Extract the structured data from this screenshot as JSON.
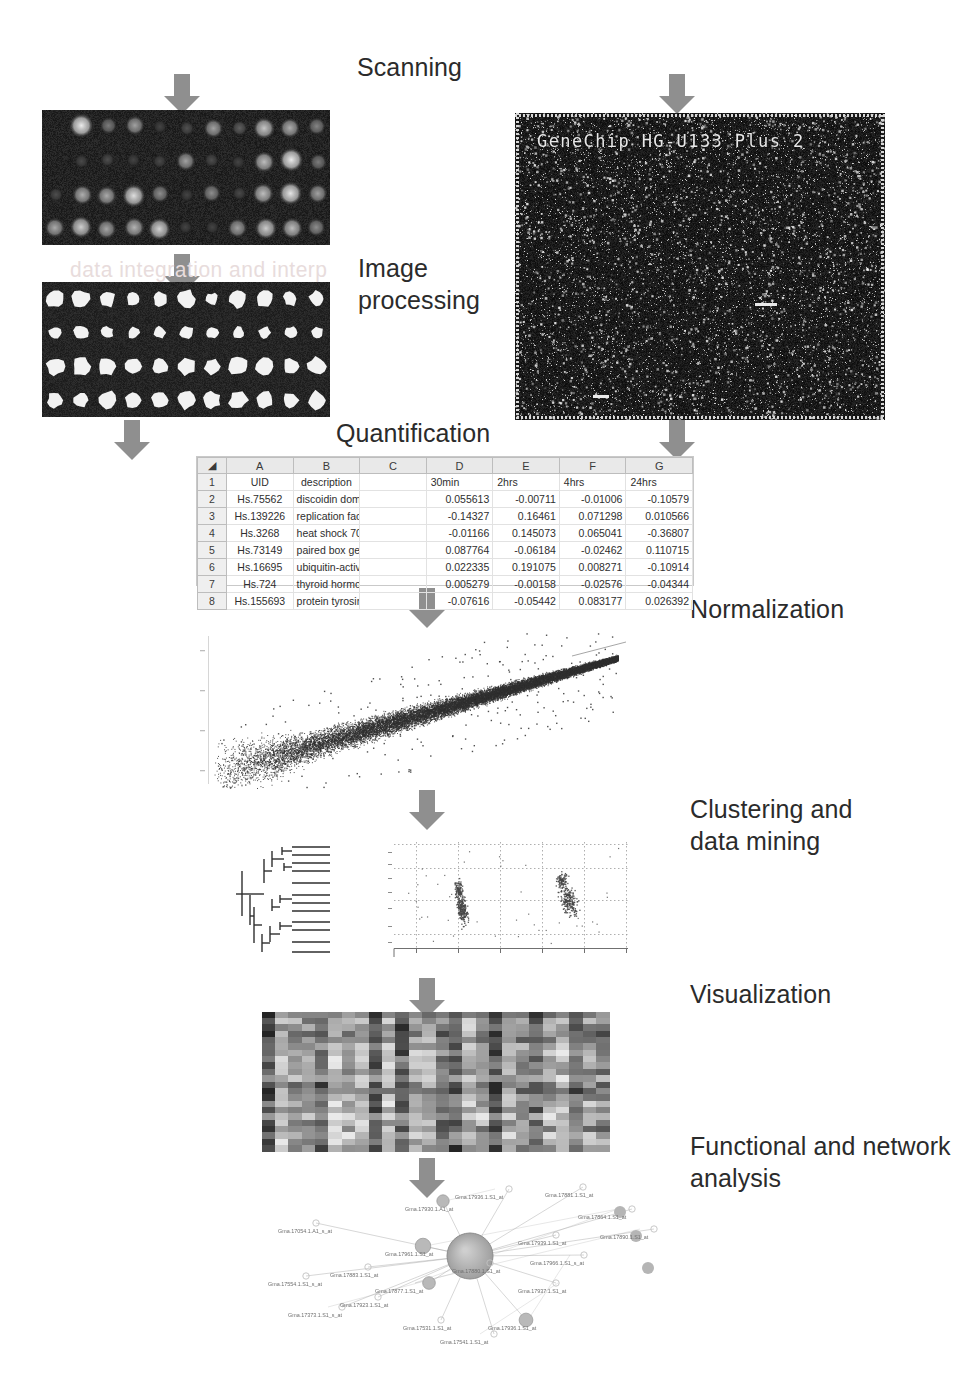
{
  "workflow": {
    "title": "Microarray data analysis workflow",
    "steps": [
      {
        "id": "scanning",
        "label": "Scanning"
      },
      {
        "id": "image-processing",
        "label": "Image\nprocessing"
      },
      {
        "id": "quantification",
        "label": "Quantification"
      },
      {
        "id": "normalization",
        "label": "Normalization"
      },
      {
        "id": "clustering",
        "label": "Clustering and\ndata mining"
      },
      {
        "id": "visualization",
        "label": "Visualization"
      },
      {
        "id": "functional",
        "label": "Functional and network\nanalysis"
      }
    ]
  },
  "colors": {
    "arrow": "#8f8f8f",
    "arrow_dark": "#7a7a7a",
    "panel_bg": "#101010",
    "text": "#2b2b2b",
    "grid": "#cfcfcf",
    "scatter": "#3a3a3a"
  },
  "panels": {
    "spotted_array": {
      "name": "two-colour spotted microarray scan",
      "rows": 4,
      "cols": 11
    },
    "segmented_array": {
      "name": "segmented / spot-found image",
      "rows": 4,
      "cols": 11
    },
    "genechip": {
      "name": "Affymetrix GeneChip array image",
      "label": "GeneChip HG-U133 Plus 2"
    },
    "ghost_text": "data integration and interp"
  },
  "spreadsheet": {
    "column_letters": [
      "",
      "A",
      "B",
      "C",
      "D",
      "E",
      "F",
      "G"
    ],
    "header_row_number": "1",
    "header_cells": [
      "UID",
      "description",
      "",
      "30min",
      "2hrs",
      "4hrs",
      "24hrs"
    ],
    "rows": [
      {
        "n": "2",
        "uid": "Hs.75562",
        "description": "discoidin domain r",
        "v30min": "0.055613",
        "v2hrs": "-0.00711",
        "v4hrs": "-0.01006",
        "v24hrs": "-0.10579"
      },
      {
        "n": "3",
        "uid": "Hs.139226",
        "description": "replication factor C",
        "v30min": "-0.14327",
        "v2hrs": "0.16461",
        "v4hrs": "0.071298",
        "v24hrs": "0.010566"
      },
      {
        "n": "4",
        "uid": "Hs.3268",
        "description": "heat shock 70kD p",
        "v30min": "-0.01166",
        "v2hrs": "0.145073",
        "v4hrs": "0.065041",
        "v24hrs": "-0.36807"
      },
      {
        "n": "5",
        "uid": "Hs.73149",
        "description": "paired box gene 8",
        "v30min": "0.087764",
        "v2hrs": "-0.06184",
        "v4hrs": "-0.02462",
        "v24hrs": "0.110715"
      },
      {
        "n": "6",
        "uid": "Hs.16695",
        "description": "ubiquitin-activating",
        "v30min": "0.022335",
        "v2hrs": "0.191075",
        "v4hrs": "0.008271",
        "v24hrs": "-0.10914"
      },
      {
        "n": "7",
        "uid": "Hs.724",
        "description": "thyroid hormone re",
        "v30min": "0.005279",
        "v2hrs": "-0.00158",
        "v4hrs": "-0.02576",
        "v24hrs": "-0.04344"
      },
      {
        "n": "8",
        "uid": "Hs.155693",
        "description": "protein tyrosine ph",
        "v30min": "-0.07616",
        "v2hrs": "-0.05442",
        "v4hrs": "0.083177",
        "v24hrs": "0.026392"
      }
    ]
  },
  "chart_data": [
    {
      "id": "normalization-scatter",
      "type": "scatter",
      "title": "",
      "xlabel": "",
      "ylabel": "",
      "xlim": [
        0,
        1
      ],
      "ylim": [
        0,
        1
      ],
      "grid": false,
      "legend": "none",
      "description": "dense comet-shaped cloud of tens of thousands of points rising from lower-left to upper-right",
      "n_points": 18000,
      "series": [
        {
          "name": "intensity pairs",
          "color": "#3a3a3a"
        }
      ]
    },
    {
      "id": "cluster-dendrogram",
      "type": "tree",
      "title": "",
      "description": "hierarchical clustering dendrogram, ~12 leaves, two main branches",
      "leaves": 12
    },
    {
      "id": "cluster-scatter",
      "type": "scatter",
      "title": "",
      "xlabel": "",
      "ylabel": "",
      "grid": true,
      "description": "two dense clusters of points on a dotted grid",
      "series": [
        {
          "name": "cluster 1",
          "color": "#6b6b6b"
        },
        {
          "name": "cluster 2",
          "color": "#6b6b6b"
        }
      ]
    },
    {
      "id": "expression-heatmap",
      "type": "heatmap",
      "title": "",
      "rows": 22,
      "cols": 26,
      "colormap": "grayscale",
      "description": "grayscale gene-expression heat map, 22 rows by 26 columns"
    }
  ],
  "network": {
    "hub_label": "Gma.17880.1.S1_at",
    "nodes": [
      {
        "label": "Gma.17936.1.S1_at",
        "x": 455,
        "y": 1194
      },
      {
        "label": "Gma.17881.1.S1_at",
        "x": 545,
        "y": 1192
      },
      {
        "label": "Gma.17930.1.A1_at",
        "x": 405,
        "y": 1206
      },
      {
        "label": "Gma.17864.1.S1_at",
        "x": 578,
        "y": 1214
      },
      {
        "label": "Gma.17054.1.A1_s_at",
        "x": 278,
        "y": 1228
      },
      {
        "label": "Gma.17939.1.S1_at",
        "x": 518,
        "y": 1240
      },
      {
        "label": "Gma.17890.1.S1_at",
        "x": 600,
        "y": 1234
      },
      {
        "label": "Gma.17961.1.S1_at",
        "x": 385,
        "y": 1251
      },
      {
        "label": "Gma.17880.1.S1_at",
        "x": 452,
        "y": 1268
      },
      {
        "label": "Gma.17966.1.S1_s_at",
        "x": 530,
        "y": 1260
      },
      {
        "label": "Gma.17883.1.S1_at",
        "x": 330,
        "y": 1272
      },
      {
        "label": "Gma.17554.1.S1_s_at",
        "x": 268,
        "y": 1281
      },
      {
        "label": "Gma.17877.1.S1_at",
        "x": 375,
        "y": 1288
      },
      {
        "label": "Gma.17937.1.S1_at",
        "x": 518,
        "y": 1288
      },
      {
        "label": "Gma.17923.1.S1_at",
        "x": 340,
        "y": 1302
      },
      {
        "label": "Gma.17373.1.S1_s_at",
        "x": 288,
        "y": 1312
      },
      {
        "label": "Gma.17531.1.S1_at",
        "x": 403,
        "y": 1325
      },
      {
        "label": "Gma.17936.1.S1_at",
        "x": 488,
        "y": 1325
      },
      {
        "label": "Gma.17541.1.S1_at",
        "x": 440,
        "y": 1339
      }
    ]
  }
}
